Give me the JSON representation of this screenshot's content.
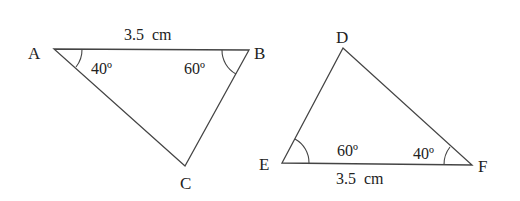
{
  "diagram": {
    "triangles": [
      {
        "name": "ABC",
        "vertices": [
          {
            "label": "A",
            "x": 54,
            "y": 49
          },
          {
            "label": "B",
            "x": 249,
            "y": 50
          },
          {
            "label": "C",
            "x": 185,
            "y": 166
          }
        ],
        "side_label": {
          "side": "AB",
          "text": "3.5  cm"
        },
        "angles": [
          {
            "vertex": "A",
            "text": "40º"
          },
          {
            "vertex": "B",
            "text": "60º"
          }
        ]
      },
      {
        "name": "DEF",
        "vertices": [
          {
            "label": "D",
            "x": 343,
            "y": 48
          },
          {
            "label": "E",
            "x": 282,
            "y": 163
          },
          {
            "label": "F",
            "x": 472,
            "y": 165
          }
        ],
        "side_label": {
          "side": "EF",
          "text": "3.5  cm"
        },
        "angles": [
          {
            "vertex": "E",
            "text": "60º"
          },
          {
            "vertex": "F",
            "text": "40º"
          }
        ]
      }
    ],
    "colors": {
      "stroke": "#444444",
      "text": "#222222",
      "background": "#ffffff"
    }
  }
}
